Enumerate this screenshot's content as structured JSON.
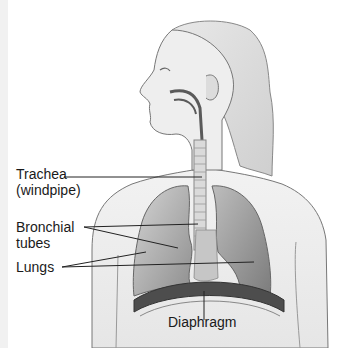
{
  "diagram": {
    "labels": [
      {
        "id": "trachea",
        "line1": "Trachea",
        "line2": "(windpipe)"
      },
      {
        "id": "bronchial",
        "line1": "Bronchial",
        "line2": "tubes"
      },
      {
        "id": "lungs",
        "line1": "Lungs"
      },
      {
        "id": "diaphragm",
        "line1": "Diaphragm"
      }
    ],
    "colors": {
      "outline": "#555555",
      "lung_fill": "#9a9a9a",
      "airway_dark": "#5a5a5a",
      "diaphragm_dark": "#4a4a4a",
      "label_text": "#1a1a1a",
      "leader_line": "#222222"
    }
  }
}
